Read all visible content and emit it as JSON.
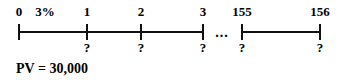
{
  "diagram": {
    "type": "cash-flow-timeline",
    "rate_label": "3%",
    "present_value_caption": "PV = 30,000",
    "ellipsis": "...",
    "axis": {
      "start_x": 19,
      "end_x": 320,
      "y": 31,
      "gap_start_x": 203,
      "gap_end_x": 242
    },
    "periods": [
      {
        "label": "0",
        "x": 19,
        "flow": "",
        "has_tick": true
      },
      {
        "label": "1",
        "x": 87,
        "flow": "?",
        "has_tick": true
      },
      {
        "label": "2",
        "x": 141,
        "flow": "?",
        "has_tick": true
      },
      {
        "label": "3",
        "x": 203,
        "flow": "?",
        "has_tick": true
      },
      {
        "label": "155",
        "x": 242,
        "flow": "?",
        "has_tick": true
      },
      {
        "label": "156",
        "x": 320,
        "flow": "?",
        "has_tick": true
      }
    ],
    "rate_x": 45,
    "ellipsis_x": 222,
    "label_y": 5,
    "flow_y": 41,
    "caption_x": 16,
    "caption_y": 62,
    "colors": {
      "ink": "#111111",
      "background": "#ffffff"
    }
  }
}
